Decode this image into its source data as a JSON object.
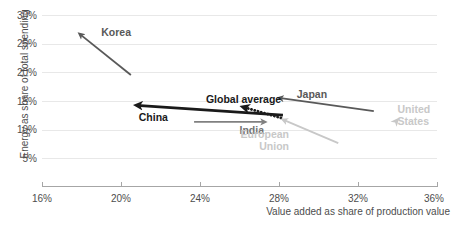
{
  "chart_data": {
    "type": "scatter",
    "title": "",
    "subtitle": "",
    "xlabel": "Value added as share of production value",
    "ylabel": "Energy as share of total spending",
    "xlim": [
      16,
      36
    ],
    "ylim": [
      2.5,
      32.5
    ],
    "x_ticks": [
      "16%",
      "20%",
      "24%",
      "28%",
      "32%",
      "36%"
    ],
    "x_tick_values": [
      16,
      20,
      24,
      28,
      32,
      36
    ],
    "y_ticks": [
      "30%",
      "25%",
      "20%",
      "15%",
      "10%",
      "5%"
    ],
    "y_tick_values": [
      30,
      25,
      20,
      15,
      10,
      5
    ],
    "grid": "horizontal",
    "legend": "inline-annotations",
    "series": [
      {
        "name": "Korea",
        "label": "Korea",
        "color": "#595959",
        "style": "solid",
        "weight": "normal",
        "start": [
          20.5,
          19.5
        ],
        "end": [
          17.9,
          26.7
        ],
        "label_pos": [
          19.0,
          27.0
        ]
      },
      {
        "name": "China",
        "label": "China",
        "color": "#1a1a1a",
        "style": "solid",
        "weight": "bold",
        "start": [
          28.2,
          12.5
        ],
        "end": [
          20.8,
          14.2
        ],
        "label_pos": [
          20.9,
          12.2
        ]
      },
      {
        "name": "Global average",
        "label": "Global average",
        "color": "#1a1a1a",
        "style": "dotted",
        "weight": "bold",
        "start": [
          28.1,
          12.0
        ],
        "end": [
          26.2,
          13.9
        ],
        "label_pos": [
          24.3,
          15.4
        ]
      },
      {
        "name": "India",
        "label": "India",
        "color": "#808080",
        "style": "solid",
        "weight": "normal",
        "start": [
          23.7,
          11.3
        ],
        "end": [
          27.3,
          11.3
        ],
        "label_pos": [
          26.0,
          9.9
        ]
      },
      {
        "name": "European Union",
        "label": "European\nUnion",
        "color": "#c8c8c8",
        "style": "solid",
        "weight": "normal",
        "start": [
          31.0,
          7.6
        ],
        "end": [
          28.2,
          11.7
        ],
        "label_pos": [
          28.0,
          9.2
        ]
      },
      {
        "name": "Japan",
        "label": "Japan",
        "color": "#595959",
        "style": "solid",
        "weight": "normal",
        "start": [
          32.8,
          13.2
        ],
        "end": [
          28.0,
          15.5
        ],
        "label_pos": [
          28.9,
          16.2
        ]
      },
      {
        "name": "United States",
        "label": "United\nStates",
        "color": "#c8c8c8",
        "style": "marker-only",
        "weight": "normal",
        "start": [
          33.9,
          11.3
        ],
        "end": [
          33.8,
          10.9
        ],
        "label_pos": [
          34.0,
          13.6
        ]
      }
    ]
  },
  "axis": {
    "x_title": "Value added as share of production value",
    "y_title": "Energy as share of total spending"
  },
  "colors": {
    "gridline": "#e8e8e8",
    "axis": "#a6a6a6",
    "tick_text": "#4d4d4d",
    "dark": "#1a1a1a",
    "mid_dark": "#595959",
    "mid": "#808080",
    "light": "#c8c8c8"
  }
}
